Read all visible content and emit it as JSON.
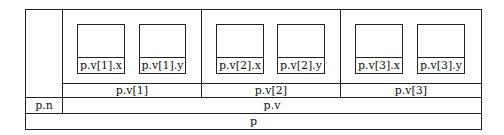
{
  "diagram": {
    "root": "p",
    "n_label": "p.n",
    "v_label": "p.v",
    "elements": [
      {
        "label": "p.v[1]",
        "x_label": "p.v[1].x",
        "y_label": "p.v[1].y"
      },
      {
        "label": "p.v[2]",
        "x_label": "p.v[2].x",
        "y_label": "p.v[2].y"
      },
      {
        "label": "p.v[3]",
        "x_label": "p.v[3].x",
        "y_label": "p.v[3].y"
      }
    ]
  }
}
